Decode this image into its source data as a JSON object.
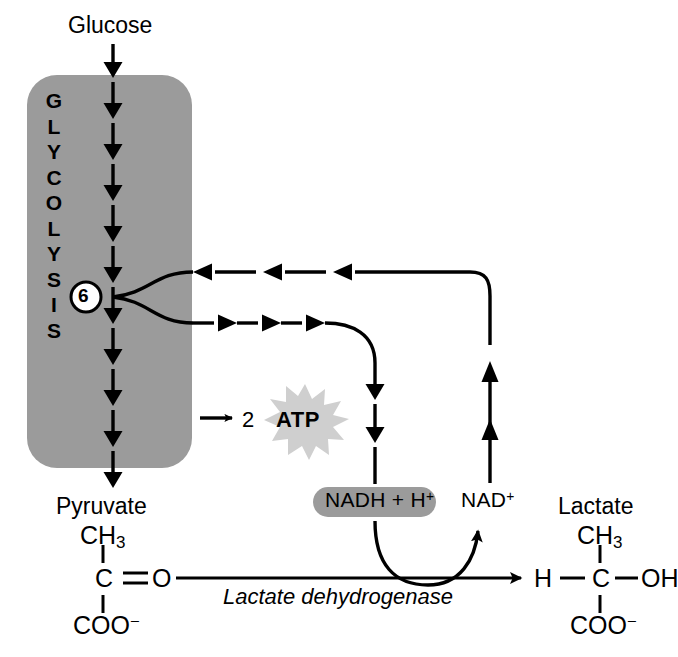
{
  "diagram": {
    "colors": {
      "box_gray": "#9b9b9b",
      "oval_gray": "#9b9b9b",
      "atp_star_gray": "#cfcfcf",
      "stroke": "#000000",
      "background": "#ffffff"
    },
    "pathway_box": {
      "label_letters": [
        "G",
        "L",
        "Y",
        "C",
        "O",
        "L",
        "Y",
        "S",
        "I",
        "S"
      ],
      "label_text": "GLYCOLYSIS"
    },
    "nodes": {
      "glucose": "Glucose",
      "pyruvate": "Pyruvate",
      "lactate": "Lactate",
      "step_number": "6",
      "atp_count": "2",
      "atp": "ATP",
      "nadh": "NADH + H",
      "nadh_charge": "+",
      "nad": "NAD",
      "nad_charge": "+",
      "enzyme": "Lactate dehydrogenase"
    },
    "structures": {
      "pyruvate": {
        "top": "CH",
        "top_sub": "3",
        "middle_left": "C",
        "middle_bond": "O",
        "bottom": "COO",
        "bottom_charge": "−"
      },
      "lactate": {
        "top": "CH",
        "top_sub": "3",
        "middle_left": "H",
        "middle_center": "C",
        "middle_right": "OH",
        "bottom": "COO",
        "bottom_charge": "−"
      }
    }
  }
}
